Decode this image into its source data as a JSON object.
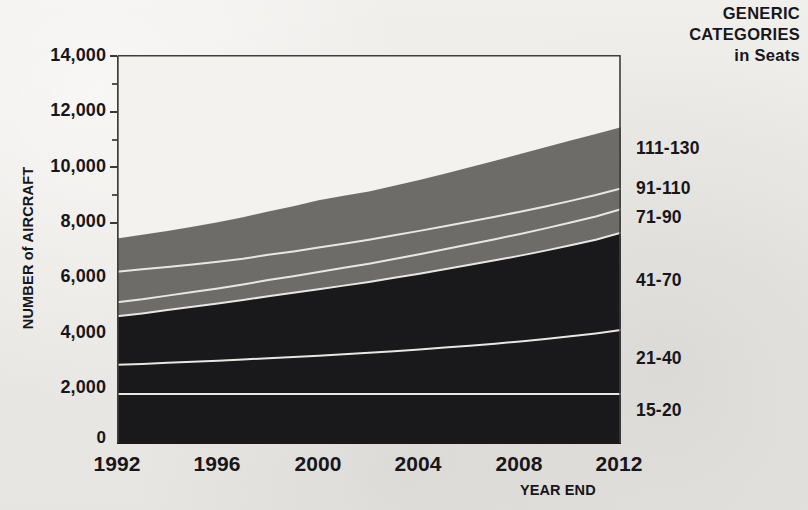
{
  "axes": {
    "y_title": "NUMBER of AIRCRAFT",
    "x_title": "YEAR END",
    "y_ticks": [
      "14,000",
      "12,000",
      "10,000",
      "8,000",
      "6,000",
      "4,000",
      "2,000",
      "0"
    ],
    "x_ticks": [
      "1992",
      "1996",
      "2000",
      "2004",
      "2008",
      "2012"
    ]
  },
  "legend": {
    "heading_line1": "GENERIC",
    "heading_line2": "CATEGORIES",
    "heading_line3": "in Seats",
    "items": [
      {
        "label": "111-130",
        "color": "#6e6c69"
      },
      {
        "label": "91-110",
        "color": "#6e6c69"
      },
      {
        "label": "71-90",
        "color": "#6e6c69"
      },
      {
        "label": "41-70",
        "color": "#19181a"
      },
      {
        "label": "21-40",
        "color": "#19181a"
      },
      {
        "label": "15-20",
        "color": "#19181a"
      }
    ]
  },
  "chart_data": {
    "type": "area",
    "stacked": true,
    "title": "",
    "xlabel": "YEAR END",
    "ylabel": "NUMBER of AIRCRAFT",
    "xlim": [
      1992,
      2012
    ],
    "ylim": [
      0,
      14000
    ],
    "ytick_step": 2000,
    "grid": false,
    "legend_position": "right",
    "x": [
      1992,
      1993,
      1994,
      1995,
      1996,
      1997,
      1998,
      1999,
      2000,
      2001,
      2002,
      2003,
      2004,
      2005,
      2006,
      2007,
      2008,
      2009,
      2010,
      2011,
      2012
    ],
    "series": [
      {
        "name": "15-20",
        "color": "#19181a",
        "values": [
          1800,
          1800,
          1800,
          1800,
          1800,
          1800,
          1800,
          1800,
          1800,
          1800,
          1800,
          1800,
          1800,
          1800,
          1800,
          1800,
          1800,
          1800,
          1800,
          1800,
          1800
        ]
      },
      {
        "name": "21-40",
        "color": "#19181a",
        "values": [
          1050,
          1080,
          1120,
          1160,
          1200,
          1240,
          1290,
          1330,
          1380,
          1430,
          1480,
          1540,
          1600,
          1670,
          1740,
          1810,
          1890,
          1980,
          2080,
          2180,
          2300
        ]
      },
      {
        "name": "41-70",
        "color": "#19181a",
        "values": [
          1750,
          1820,
          1900,
          1980,
          2060,
          2140,
          2230,
          2310,
          2390,
          2470,
          2550,
          2640,
          2730,
          2820,
          2910,
          3000,
          3090,
          3180,
          3270,
          3370,
          3500
        ]
      },
      {
        "name": "71-90",
        "color": "#6e6c69",
        "values": [
          500,
          510,
          520,
          530,
          540,
          560,
          580,
          600,
          620,
          640,
          660,
          680,
          700,
          720,
          740,
          760,
          780,
          800,
          820,
          840,
          850
        ]
      },
      {
        "name": "91-110",
        "color": "#6e6c69",
        "values": [
          1100,
          1080,
          1030,
          990,
          960,
          930,
          910,
          890,
          880,
          870,
          860,
          850,
          840,
          830,
          820,
          810,
          800,
          790,
          780,
          770,
          750
        ]
      },
      {
        "name": "111-130",
        "color": "#6e6c69",
        "values": [
          1200,
          1240,
          1300,
          1360,
          1420,
          1490,
          1560,
          1630,
          1700,
          1720,
          1740,
          1780,
          1830,
          1890,
          1950,
          2010,
          2080,
          2130,
          2170,
          2200,
          2200
        ]
      }
    ],
    "cumulative_tops": {
      "15-20": [
        1800,
        1800,
        1800,
        1800,
        1800,
        1800,
        1800,
        1800,
        1800,
        1800,
        1800,
        1800,
        1800,
        1800,
        1800,
        1800,
        1800,
        1800,
        1800,
        1800,
        1800
      ],
      "21-40": [
        2850,
        2880,
        2920,
        2960,
        3000,
        3040,
        3090,
        3130,
        3180,
        3230,
        3280,
        3340,
        3400,
        3470,
        3540,
        3610,
        3690,
        3780,
        3880,
        3980,
        4100
      ],
      "41-70": [
        4600,
        4700,
        4820,
        4940,
        5060,
        5180,
        5320,
        5440,
        5570,
        5700,
        5830,
        5980,
        6130,
        6290,
        6450,
        6610,
        6780,
        6960,
        7150,
        7350,
        7600
      ],
      "71-90": [
        5100,
        5210,
        5340,
        5470,
        5600,
        5740,
        5900,
        6040,
        6190,
        6340,
        6490,
        6660,
        6830,
        7010,
        7190,
        7370,
        7560,
        7760,
        7970,
        8190,
        8450
      ],
      "91-110": [
        6200,
        6290,
        6370,
        6460,
        6560,
        6670,
        6810,
        6930,
        7070,
        7210,
        7350,
        7510,
        7670,
        7840,
        8010,
        8180,
        8360,
        8550,
        8750,
        8960,
        9200
      ],
      "111-130": [
        7400,
        7530,
        7670,
        7820,
        7980,
        8160,
        8370,
        8560,
        8770,
        8930,
        9090,
        9290,
        9500,
        9730,
        9960,
        10190,
        10440,
        10680,
        10920,
        11160,
        11400
      ]
    }
  }
}
